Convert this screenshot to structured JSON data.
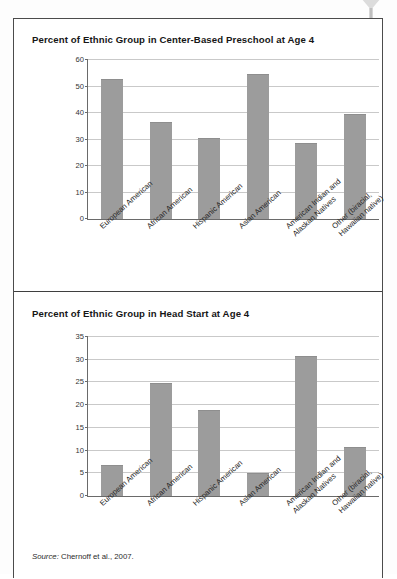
{
  "frame": {
    "border_color": "#4b4b4b"
  },
  "colors": {
    "bar": "#9c9c9c",
    "grid": "#c9c9c9",
    "axis": "#6a6a6a",
    "text": "#161616"
  },
  "source": {
    "label": "Source:",
    "citation": "Chernoff et al., 2007."
  },
  "chart_data": [
    {
      "type": "bar",
      "title": "Percent of Ethnic Group in Center-Based Preschool at Age 4",
      "xlabel": "",
      "ylabel": "",
      "ylim": [
        0,
        60
      ],
      "yticks": [
        0,
        10,
        20,
        30,
        40,
        50,
        60
      ],
      "ytick_labels": [
        "0",
        "10",
        "20",
        "30",
        "40",
        "50",
        "60"
      ],
      "grid": true,
      "legend": "none",
      "categories": [
        "European American",
        "African American",
        "Hispanic American",
        "Asian American",
        "American Indian and Alaskan Natives",
        "Other (biracial, Hawaiian native)"
      ],
      "category_lines": [
        [
          "European American"
        ],
        [
          "African American"
        ],
        [
          "Hispanic American"
        ],
        [
          "Asian American"
        ],
        [
          "American Indian and",
          "Alaskan Natives"
        ],
        [
          "Other (biracial,",
          "Hawaiian native)"
        ]
      ],
      "values": [
        52.8,
        36.6,
        30.7,
        54.6,
        28.5,
        39.7
      ]
    },
    {
      "type": "bar",
      "title": "Percent of Ethnic Group in Head Start at Age 4",
      "xlabel": "",
      "ylabel": "",
      "ylim": [
        0,
        35
      ],
      "yticks": [
        0,
        5,
        10,
        15,
        20,
        25,
        30,
        35
      ],
      "ytick_labels": [
        "0",
        "5",
        "10",
        "15",
        "20",
        "25",
        "30",
        "35"
      ],
      "grid": true,
      "legend": "none",
      "categories": [
        "European American",
        "African American",
        "Hispanic American",
        "Asian American",
        "American Indian and Alaskan Natives",
        "Other (biracial, Hawaiian native)"
      ],
      "category_lines": [
        [
          "European American"
        ],
        [
          "African American"
        ],
        [
          "Hispanic American"
        ],
        [
          "Asian American"
        ],
        [
          "American Indian and",
          "Alaskan Natives"
        ],
        [
          "Other (biracial,",
          "Hawaiian native)"
        ]
      ],
      "values": [
        6.8,
        24.9,
        18.9,
        5.0,
        30.8,
        10.8
      ]
    }
  ]
}
